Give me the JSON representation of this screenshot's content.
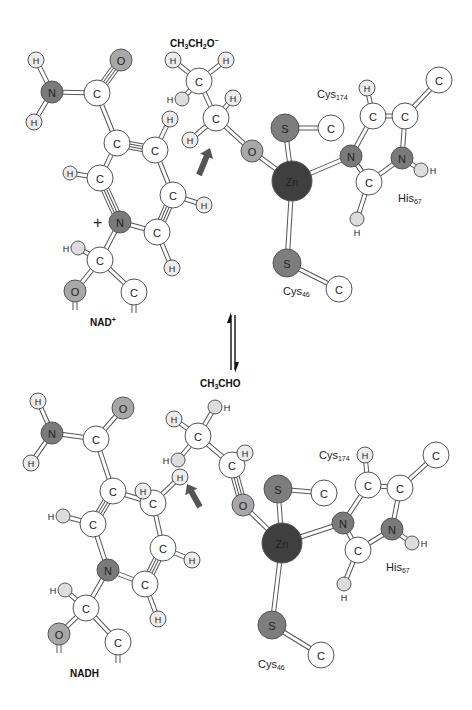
{
  "colors": {
    "C": "#ffffff",
    "H": "#ececec",
    "Hs": "#dddddd",
    "N": "#7a7a7a",
    "O": "#a8a8a8",
    "S": "#7d7d7d",
    "Zn": "#3f3f3f",
    "arrow": "#555555",
    "stroke": "#555555",
    "text": "#222222"
  },
  "radius": {
    "C": 13,
    "H": 8,
    "Hs": 7,
    "N": 11,
    "O": 11,
    "S": 14,
    "Zn": 20
  },
  "panels": [
    {
      "name": "top",
      "compound_label": "CH3CH2O−",
      "compound_label_parts": [
        "CH",
        "3",
        "CH",
        "2",
        "O",
        "−"
      ],
      "cofactor_label": "NAD",
      "cofactor_sup": "+",
      "cys174_label": "Cys",
      "cys174_sub": "174",
      "cys46_label": "Cys",
      "cys46_sub": "46",
      "his_label": "His",
      "his_sub": "67"
    },
    {
      "name": "bottom",
      "compound_label": "CH3CHO",
      "compound_label_parts": [
        "CH",
        "3",
        "CHO",
        "",
        "",
        ""
      ],
      "cofactor_label": "NADH",
      "cofactor_sup": "",
      "cys174_label": "Cys",
      "cys174_sub": "174",
      "cys46_label": "Cys",
      "cys46_sub": "46",
      "his_label": "His",
      "his_sub": "67"
    }
  ],
  "equilibrium_arrow": {
    "x": 233,
    "y_top": 312,
    "y_bottom": 372
  },
  "diagram": {
    "atoms": [
      {
        "id": "t_H1",
        "el": "H",
        "x": 36,
        "y": 60,
        "label": "H"
      },
      {
        "id": "t_N1",
        "el": "N",
        "x": 52,
        "y": 92,
        "label": "N"
      },
      {
        "id": "t_H2",
        "el": "H",
        "x": 34,
        "y": 122,
        "label": "H"
      },
      {
        "id": "t_O1",
        "el": "O",
        "x": 121,
        "y": 60,
        "label": "O"
      },
      {
        "id": "t_C1",
        "el": "C",
        "x": 97,
        "y": 93,
        "label": "C"
      },
      {
        "id": "t_C2",
        "el": "C",
        "x": 117,
        "y": 143,
        "label": "C"
      },
      {
        "id": "t_C3",
        "el": "C",
        "x": 155,
        "y": 150,
        "label": "C"
      },
      {
        "id": "t_H3",
        "el": "H",
        "x": 170,
        "y": 119,
        "label": "H"
      },
      {
        "id": "t_C4",
        "el": "C",
        "x": 100,
        "y": 178,
        "label": "C"
      },
      {
        "id": "t_H4",
        "el": "H",
        "x": 70,
        "y": 173,
        "label": "H",
        "sz": "Hs"
      },
      {
        "id": "t_N2",
        "el": "N",
        "x": 120,
        "y": 222,
        "label": "N"
      },
      {
        "id": "t_C5",
        "el": "C",
        "x": 173,
        "y": 195,
        "label": "C"
      },
      {
        "id": "t_H5",
        "el": "H",
        "x": 204,
        "y": 205,
        "label": "H"
      },
      {
        "id": "t_C6",
        "el": "C",
        "x": 157,
        "y": 232,
        "label": "C"
      },
      {
        "id": "t_H6",
        "el": "H",
        "x": 172,
        "y": 268,
        "label": "H"
      },
      {
        "id": "t_C7",
        "el": "C",
        "x": 100,
        "y": 260,
        "label": "C"
      },
      {
        "id": "t_H7",
        "el": "Hs",
        "x": 78,
        "y": 248,
        "label": "",
        "side": "H"
      },
      {
        "id": "t_O2",
        "el": "O",
        "x": 75,
        "y": 291,
        "label": "O"
      },
      {
        "id": "t_C8",
        "el": "C",
        "x": 134,
        "y": 292,
        "label": "C"
      },
      {
        "id": "t_CH3",
        "el": "C",
        "x": 199,
        "y": 81,
        "label": "C"
      },
      {
        "id": "t_Ha",
        "el": "H",
        "x": 173,
        "y": 60,
        "label": "H"
      },
      {
        "id": "t_Hb",
        "el": "H",
        "x": 226,
        "y": 60,
        "label": "H"
      },
      {
        "id": "t_Hc",
        "el": "Hs",
        "x": 182,
        "y": 99,
        "label": "",
        "side": "H"
      },
      {
        "id": "t_CH2",
        "el": "C",
        "x": 216,
        "y": 118,
        "label": "C"
      },
      {
        "id": "t_Hd",
        "el": "H",
        "x": 233,
        "y": 98,
        "label": "H"
      },
      {
        "id": "t_He",
        "el": "H",
        "x": 190,
        "y": 140,
        "label": "H"
      },
      {
        "id": "t_O3",
        "el": "O",
        "x": 252,
        "y": 151,
        "label": "O"
      },
      {
        "id": "t_Zn",
        "el": "Zn",
        "x": 292,
        "y": 181,
        "label": "Zn"
      },
      {
        "id": "t_S1",
        "el": "S",
        "x": 285,
        "y": 128,
        "label": "S"
      },
      {
        "id": "t_C9",
        "el": "C",
        "x": 331,
        "y": 128,
        "label": "C"
      },
      {
        "id": "t_N3",
        "el": "N",
        "x": 351,
        "y": 156,
        "label": "N"
      },
      {
        "id": "t_C10",
        "el": "C",
        "x": 369,
        "y": 182,
        "label": "C"
      },
      {
        "id": "t_H8",
        "el": "Hs",
        "x": 357,
        "y": 219,
        "label": "",
        "below": "H"
      },
      {
        "id": "t_N4",
        "el": "N",
        "x": 402,
        "y": 158,
        "label": "N"
      },
      {
        "id": "t_H9",
        "el": "Hs",
        "x": 421,
        "y": 170,
        "label": "",
        "side_r": "H"
      },
      {
        "id": "t_C11",
        "el": "C",
        "x": 373,
        "y": 116,
        "label": "C"
      },
      {
        "id": "t_H10",
        "el": "H",
        "x": 367,
        "y": 88,
        "label": "H"
      },
      {
        "id": "t_C12",
        "el": "C",
        "x": 405,
        "y": 116,
        "label": "C"
      },
      {
        "id": "t_C13",
        "el": "C",
        "x": 439,
        "y": 80,
        "label": "C"
      },
      {
        "id": "t_S2",
        "el": "S",
        "x": 287,
        "y": 263,
        "label": "S"
      },
      {
        "id": "t_C14",
        "el": "C",
        "x": 339,
        "y": 289,
        "label": "C"
      },
      {
        "id": "b_H1",
        "el": "H",
        "x": 38,
        "y": 401,
        "label": "H"
      },
      {
        "id": "b_N1",
        "el": "N",
        "x": 52,
        "y": 433,
        "label": "N"
      },
      {
        "id": "b_H2",
        "el": "H",
        "x": 31,
        "y": 463,
        "label": "H"
      },
      {
        "id": "b_O1",
        "el": "O",
        "x": 123,
        "y": 408,
        "label": "O"
      },
      {
        "id": "b_C1",
        "el": "C",
        "x": 96,
        "y": 439,
        "label": "C"
      },
      {
        "id": "b_C2",
        "el": "C",
        "x": 113,
        "y": 491,
        "label": "C"
      },
      {
        "id": "b_C3",
        "el": "C",
        "x": 153,
        "y": 503,
        "label": "C"
      },
      {
        "id": "b_H3a",
        "el": "H",
        "x": 143,
        "y": 491,
        "label": "H"
      },
      {
        "id": "b_H3b",
        "el": "H",
        "x": 180,
        "y": 477,
        "label": "H"
      },
      {
        "id": "b_C4",
        "el": "C",
        "x": 93,
        "y": 524,
        "label": "C"
      },
      {
        "id": "b_H4",
        "el": "Hs",
        "x": 63,
        "y": 516,
        "label": "",
        "side": "H"
      },
      {
        "id": "b_N2",
        "el": "N",
        "x": 108,
        "y": 570,
        "label": "N"
      },
      {
        "id": "b_C5",
        "el": "C",
        "x": 163,
        "y": 548,
        "label": "C"
      },
      {
        "id": "b_H5",
        "el": "H",
        "x": 192,
        "y": 560,
        "label": "H"
      },
      {
        "id": "b_C6",
        "el": "C",
        "x": 145,
        "y": 584,
        "label": "C"
      },
      {
        "id": "b_H6",
        "el": "H",
        "x": 158,
        "y": 619,
        "label": "H"
      },
      {
        "id": "b_C7",
        "el": "C",
        "x": 86,
        "y": 608,
        "label": "C"
      },
      {
        "id": "b_H7",
        "el": "Hs",
        "x": 65,
        "y": 590,
        "label": "",
        "side": "H"
      },
      {
        "id": "b_O2",
        "el": "O",
        "x": 59,
        "y": 634,
        "label": "O"
      },
      {
        "id": "b_C8",
        "el": "C",
        "x": 118,
        "y": 642,
        "label": "C"
      },
      {
        "id": "b_CH3",
        "el": "C",
        "x": 198,
        "y": 436,
        "label": "C"
      },
      {
        "id": "b_Ha",
        "el": "H",
        "x": 174,
        "y": 419,
        "label": "H"
      },
      {
        "id": "b_Hb",
        "el": "Hs",
        "x": 215,
        "y": 407,
        "label": "",
        "side_r": "H"
      },
      {
        "id": "b_Hc",
        "el": "Hs",
        "x": 178,
        "y": 460,
        "label": "",
        "side": "H"
      },
      {
        "id": "b_C9a",
        "el": "C",
        "x": 232,
        "y": 465,
        "label": "C"
      },
      {
        "id": "b_Hd",
        "el": "H",
        "x": 245,
        "y": 453,
        "label": "H"
      },
      {
        "id": "b_O3",
        "el": "O",
        "x": 243,
        "y": 505,
        "label": "O"
      },
      {
        "id": "b_Zn",
        "el": "Zn",
        "x": 282,
        "y": 543,
        "label": "Zn"
      },
      {
        "id": "b_S1",
        "el": "S",
        "x": 278,
        "y": 489,
        "label": "S"
      },
      {
        "id": "b_C9",
        "el": "C",
        "x": 324,
        "y": 493,
        "label": "C"
      },
      {
        "id": "b_N3",
        "el": "N",
        "x": 343,
        "y": 523,
        "label": "N"
      },
      {
        "id": "b_C10",
        "el": "C",
        "x": 358,
        "y": 550,
        "label": "C"
      },
      {
        "id": "b_H8",
        "el": "Hs",
        "x": 344,
        "y": 584,
        "label": "",
        "below": "H"
      },
      {
        "id": "b_N4",
        "el": "N",
        "x": 392,
        "y": 529,
        "label": "N"
      },
      {
        "id": "b_H9",
        "el": "Hs",
        "x": 412,
        "y": 543,
        "label": "",
        "side_r": "H"
      },
      {
        "id": "b_C11",
        "el": "C",
        "x": 368,
        "y": 485,
        "label": "C"
      },
      {
        "id": "b_H10",
        "el": "H",
        "x": 365,
        "y": 455,
        "label": "H"
      },
      {
        "id": "b_C12",
        "el": "C",
        "x": 400,
        "y": 488,
        "label": "C"
      },
      {
        "id": "b_C13",
        "el": "C",
        "x": 436,
        "y": 455,
        "label": "C"
      },
      {
        "id": "b_S2",
        "el": "S",
        "x": 272,
        "y": 625,
        "label": "S"
      },
      {
        "id": "b_C14",
        "el": "C",
        "x": 321,
        "y": 655,
        "label": "C"
      }
    ],
    "bonds": [
      [
        "t_H1",
        "t_N1",
        1
      ],
      [
        "t_N1",
        "t_H2",
        1
      ],
      [
        "t_N1",
        "t_C1",
        1
      ],
      [
        "t_C1",
        "t_O1",
        2
      ],
      [
        "t_C1",
        "t_C2",
        1
      ],
      [
        "t_C2",
        "t_C3",
        2
      ],
      [
        "t_C3",
        "t_H3",
        1
      ],
      [
        "t_C2",
        "t_C4",
        1
      ],
      [
        "t_C4",
        "t_H4",
        1
      ],
      [
        "t_C4",
        "t_N2",
        2
      ],
      [
        "t_C3",
        "t_C5",
        1
      ],
      [
        "t_C5",
        "t_H5",
        1
      ],
      [
        "t_C5",
        "t_C6",
        2
      ],
      [
        "t_C6",
        "t_N2",
        1
      ],
      [
        "t_C6",
        "t_H6",
        1
      ],
      [
        "t_N2",
        "t_C7",
        1
      ],
      [
        "t_C7",
        "t_H7",
        1
      ],
      [
        "t_C7",
        "t_O2",
        1
      ],
      [
        "t_C7",
        "t_C8",
        1
      ],
      [
        "t_CH3",
        "t_Ha",
        1
      ],
      [
        "t_CH3",
        "t_Hb",
        1
      ],
      [
        "t_CH3",
        "t_Hc",
        1
      ],
      [
        "t_CH3",
        "t_CH2",
        1
      ],
      [
        "t_CH2",
        "t_Hd",
        1
      ],
      [
        "t_CH2",
        "t_He",
        1
      ],
      [
        "t_CH2",
        "t_O3",
        1
      ],
      [
        "t_O3",
        "t_Zn",
        1
      ],
      [
        "t_Zn",
        "t_S1",
        1
      ],
      [
        "t_S1",
        "t_C9",
        1
      ],
      [
        "t_Zn",
        "t_N3",
        1
      ],
      [
        "t_N3",
        "t_C10",
        1
      ],
      [
        "t_C10",
        "t_H8",
        1
      ],
      [
        "t_C10",
        "t_N4",
        1
      ],
      [
        "t_N4",
        "t_H9",
        1
      ],
      [
        "t_N4",
        "t_C12",
        1
      ],
      [
        "t_C12",
        "t_C11",
        1
      ],
      [
        "t_C11",
        "t_N3",
        1
      ],
      [
        "t_C11",
        "t_H10",
        1
      ],
      [
        "t_C12",
        "t_C13",
        1
      ],
      [
        "t_Zn",
        "t_S2",
        1
      ],
      [
        "t_S2",
        "t_C14",
        1
      ],
      [
        "b_H1",
        "b_N1",
        1
      ],
      [
        "b_N1",
        "b_H2",
        1
      ],
      [
        "b_N1",
        "b_C1",
        1
      ],
      [
        "b_C1",
        "b_O1",
        1
      ],
      [
        "b_C1",
        "b_C2",
        1
      ],
      [
        "b_C2",
        "b_C3",
        1
      ],
      [
        "b_C3",
        "b_H3b",
        1
      ],
      [
        "b_C2",
        "b_C4",
        2
      ],
      [
        "b_C4",
        "b_H4",
        1
      ],
      [
        "b_C4",
        "b_N2",
        1
      ],
      [
        "b_C3",
        "b_C5",
        1
      ],
      [
        "b_C5",
        "b_H5",
        1
      ],
      [
        "b_C5",
        "b_C6",
        2
      ],
      [
        "b_C6",
        "b_N2",
        1
      ],
      [
        "b_C6",
        "b_H6",
        1
      ],
      [
        "b_N2",
        "b_C7",
        1
      ],
      [
        "b_C7",
        "b_H7",
        1
      ],
      [
        "b_C7",
        "b_O2",
        1
      ],
      [
        "b_C7",
        "b_C8",
        1
      ],
      [
        "b_CH3",
        "b_Ha",
        1
      ],
      [
        "b_CH3",
        "b_Hb",
        1
      ],
      [
        "b_CH3",
        "b_Hc",
        1
      ],
      [
        "b_CH3",
        "b_C9a",
        1
      ],
      [
        "b_C9a",
        "b_Hd",
        1
      ],
      [
        "b_C9a",
        "b_O3",
        2
      ],
      [
        "b_O3",
        "b_Zn",
        1
      ],
      [
        "b_Zn",
        "b_S1",
        1
      ],
      [
        "b_S1",
        "b_C9",
        1
      ],
      [
        "b_Zn",
        "b_N3",
        1
      ],
      [
        "b_N3",
        "b_C10",
        1
      ],
      [
        "b_C10",
        "b_H8",
        1
      ],
      [
        "b_C10",
        "b_N4",
        1
      ],
      [
        "b_N4",
        "b_H9",
        1
      ],
      [
        "b_N4",
        "b_C12",
        1
      ],
      [
        "b_C12",
        "b_C11",
        1
      ],
      [
        "b_C11",
        "b_N3",
        1
      ],
      [
        "b_C11",
        "b_H10",
        1
      ],
      [
        "b_C12",
        "b_C13",
        1
      ],
      [
        "b_Zn",
        "b_S2",
        1
      ],
      [
        "b_S2",
        "b_C14",
        1
      ]
    ],
    "stubs": [
      {
        "x": 75,
        "y": 302
      },
      {
        "x": 134,
        "y": 305
      },
      {
        "x": 59,
        "y": 645
      },
      {
        "x": 118,
        "y": 655
      }
    ],
    "hydride_arrows": [
      {
        "x1": 199,
        "y1": 175,
        "x2": 210,
        "y2": 148
      },
      {
        "x1": 200,
        "y1": 507,
        "x2": 187,
        "y2": 484
      }
    ],
    "plus_sign": {
      "x": 101,
      "y": 223,
      "text": "+"
    },
    "labels": {
      "top_compound": {
        "x": 170,
        "y": 43
      },
      "top_cys174": {
        "x": 346,
        "y": 95
      },
      "top_cys46": {
        "x": 285,
        "y": 292
      },
      "top_his": {
        "x": 400,
        "y": 199
      },
      "top_nad": {
        "x": 90,
        "y": 323
      },
      "bottom_compound": {
        "x": 200,
        "y": 480
      },
      "bottom_cys174": {
        "x": 319,
        "y": 463
      },
      "bottom_cys46": {
        "x": 263,
        "y": 665
      },
      "bottom_his": {
        "x": 386,
        "y": 568
      },
      "bottom_nadh": {
        "x": 72,
        "y": 676
      }
    }
  }
}
